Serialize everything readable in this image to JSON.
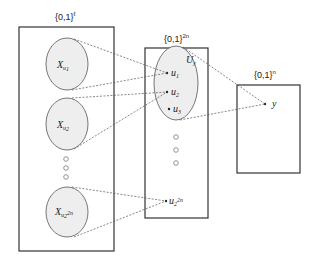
{
  "diagram": {
    "left_box": {
      "label_base": "{0,1}",
      "label_sup": "ℓ",
      "sets": [
        {
          "base": "X",
          "sub": "u",
          "subsub": "1"
        },
        {
          "base": "X",
          "sub": "u",
          "subsub": "2"
        },
        {
          "base": "X",
          "sub": "u",
          "subsub": "2",
          "subsubsup": "2n"
        }
      ],
      "ellipsis": "⋮"
    },
    "middle_box": {
      "label_base": "{0,1}",
      "label_sup": "2n",
      "subset_label_base": "U",
      "subset_label_sub": "y",
      "points": [
        {
          "base": "u",
          "sub": "1"
        },
        {
          "base": "u",
          "sub": "2"
        },
        {
          "base": "u",
          "sub": "3"
        }
      ],
      "last_point": {
        "base": "u",
        "sub": "2",
        "sup": "2n"
      }
    },
    "right_box": {
      "label_base": "{0,1}",
      "label_sup": "n",
      "point": "y"
    },
    "colors": {
      "box_stroke": "#333333",
      "ellipse_fill": "#eeeeee",
      "ellipse_stroke": "#555555",
      "dashed_line": "#555555",
      "hollow_dot": "#888888"
    }
  }
}
